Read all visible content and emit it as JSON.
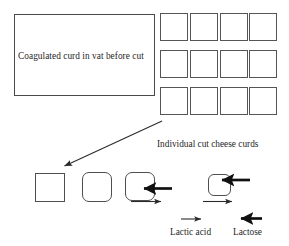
{
  "figure": {
    "title_visible": false,
    "background_color": "#ffffff",
    "stroke_color": "#4f4f4f",
    "text_color": "#1f1f1f"
  },
  "vat": {
    "label": "Coagulated curd in vat before cut",
    "shape": "rectangle"
  },
  "curd_grid": {
    "caption": "Individual cut cheese curds",
    "rows": 3,
    "columns": 4,
    "cells": [
      [
        "curd",
        "curd",
        "curd",
        "curd"
      ],
      [
        "curd",
        "curd",
        "curd",
        "curd"
      ],
      [
        "curd",
        "curd",
        "curd",
        "curd"
      ]
    ]
  },
  "pointer_arrow": {
    "icon": "diagonal-arrow-icon",
    "from": "bottom-left of cut curd grid",
    "to": "first shrinkage stage shape"
  },
  "shrinkage_stages": [
    {
      "id": "stage-1",
      "shape": "square",
      "corner": "sharp",
      "lactose_in": false,
      "lactic_acid_out": false
    },
    {
      "id": "stage-2",
      "shape": "rounded-square",
      "corner": "rounded",
      "lactose_in": false,
      "lactic_acid_out": false
    },
    {
      "id": "stage-3",
      "shape": "rounded-square",
      "corner": "rounded",
      "lactose_in": true,
      "lactic_acid_out": true
    },
    {
      "id": "stage-4",
      "shape": "rounded-square-small",
      "corner": "rounded",
      "lactose_in": true,
      "lactic_acid_out": true
    }
  ],
  "legend": {
    "items": [
      {
        "label": "Lactic acid",
        "icon": "thin-right-arrow-icon",
        "direction": "right",
        "weight": "thin"
      },
      {
        "label": "Lactose",
        "icon": "thick-left-arrow-icon",
        "direction": "left",
        "weight": "thick"
      }
    ]
  }
}
